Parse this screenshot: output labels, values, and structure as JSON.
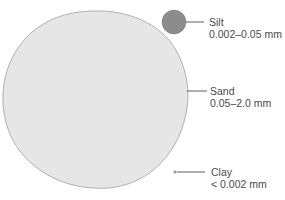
{
  "diagram": {
    "title": "",
    "particles": [
      {
        "id": "silt",
        "name": "Silt",
        "range": "0.002–0.05 mm",
        "color": "#8c8c8c"
      },
      {
        "id": "sand",
        "name": "Sand",
        "range": "0.05–2.0 mm",
        "color": "#e6e6e6"
      },
      {
        "id": "clay",
        "name": "Clay",
        "range": "< 0.002 mm",
        "color": "#9a9a9a"
      }
    ]
  }
}
